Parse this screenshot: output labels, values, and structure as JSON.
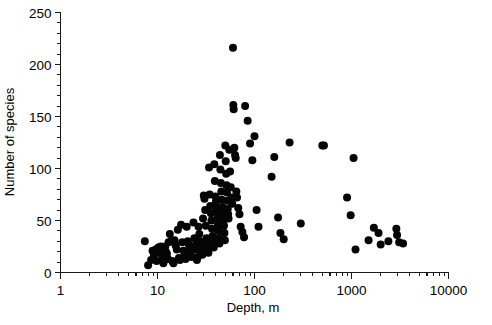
{
  "chart_data": {
    "type": "scatter",
    "title": "",
    "xlabel": "Depth, m",
    "ylabel": "Number of species",
    "xscale": "log",
    "yscale": "linear",
    "xlim": [
      1,
      10000
    ],
    "ylim": [
      0,
      250
    ],
    "grid": false,
    "legend": null,
    "x_tick_labels": [
      "1",
      "10",
      "100",
      "1000",
      "10000"
    ],
    "x_tick_values": [
      1,
      10,
      100,
      1000,
      10000
    ],
    "y_tick_labels": [
      "0",
      "50",
      "100",
      "150",
      "200",
      "250"
    ],
    "y_tick_values": [
      0,
      50,
      100,
      150,
      200,
      250
    ],
    "y_minor_step": 10,
    "marker": "filled-circle",
    "marker_color": "#050505",
    "marker_size_px": 4.6,
    "n_points": 148,
    "points": [
      [
        7.4,
        30
      ],
      [
        8.0,
        7
      ],
      [
        8.6,
        12
      ],
      [
        8.9,
        21
      ],
      [
        9.2,
        17
      ],
      [
        9.6,
        22
      ],
      [
        9.8,
        11
      ],
      [
        10.0,
        20
      ],
      [
        10.2,
        24
      ],
      [
        10.4,
        19
      ],
      [
        10.6,
        22
      ],
      [
        10.8,
        25
      ],
      [
        11.0,
        21
      ],
      [
        11.2,
        14
      ],
      [
        11.5,
        9
      ],
      [
        11.8,
        12
      ],
      [
        12.0,
        25
      ],
      [
        12.2,
        20
      ],
      [
        12.5,
        18
      ],
      [
        12.8,
        13
      ],
      [
        13.0,
        29
      ],
      [
        13.4,
        37
      ],
      [
        13.8,
        30
      ],
      [
        14.2,
        11
      ],
      [
        14.6,
        9
      ],
      [
        15.0,
        31
      ],
      [
        15.4,
        26
      ],
      [
        15.8,
        22
      ],
      [
        16.2,
        41
      ],
      [
        16.6,
        14
      ],
      [
        17.0,
        12
      ],
      [
        17.5,
        46
      ],
      [
        18.0,
        29
      ],
      [
        18.5,
        21
      ],
      [
        19.0,
        16
      ],
      [
        19.5,
        13
      ],
      [
        20.0,
        44
      ],
      [
        20.5,
        30
      ],
      [
        21.0,
        27
      ],
      [
        21.5,
        21
      ],
      [
        22.0,
        18
      ],
      [
        22.5,
        15
      ],
      [
        23.0,
        24
      ],
      [
        23.5,
        48
      ],
      [
        24.0,
        33
      ],
      [
        24.5,
        26
      ],
      [
        25.0,
        22
      ],
      [
        25.5,
        12
      ],
      [
        26.0,
        15
      ],
      [
        26.5,
        44
      ],
      [
        27.0,
        37
      ],
      [
        27.5,
        30
      ],
      [
        28.0,
        25
      ],
      [
        28.5,
        20
      ],
      [
        29.0,
        17
      ],
      [
        29.5,
        52
      ],
      [
        30.0,
        74
      ],
      [
        30.5,
        71
      ],
      [
        31.0,
        60
      ],
      [
        31.5,
        45
      ],
      [
        32.0,
        33
      ],
      [
        32.5,
        27
      ],
      [
        33.0,
        23
      ],
      [
        33.5,
        19
      ],
      [
        34.0,
        101
      ],
      [
        34.5,
        75
      ],
      [
        35.0,
        64
      ],
      [
        35.5,
        57
      ],
      [
        36.0,
        50
      ],
      [
        36.5,
        42
      ],
      [
        37.0,
        35
      ],
      [
        37.5,
        29
      ],
      [
        38.0,
        24
      ],
      [
        38.5,
        104
      ],
      [
        39.0,
        88
      ],
      [
        39.5,
        73
      ],
      [
        40.0,
        68
      ],
      [
        40.5,
        62
      ],
      [
        41.0,
        58
      ],
      [
        41.5,
        52
      ],
      [
        42.0,
        46
      ],
      [
        42.5,
        40
      ],
      [
        43.0,
        33
      ],
      [
        43.5,
        28
      ],
      [
        44.0,
        113
      ],
      [
        44.5,
        99
      ],
      [
        45.0,
        86
      ],
      [
        45.5,
        78
      ],
      [
        46.0,
        70
      ],
      [
        46.5,
        63
      ],
      [
        47.0,
        59
      ],
      [
        47.5,
        55
      ],
      [
        48.0,
        50
      ],
      [
        48.5,
        45
      ],
      [
        49.0,
        38
      ],
      [
        49.5,
        31
      ],
      [
        50.0,
        122
      ],
      [
        50.5,
        107
      ],
      [
        51.0,
        95
      ],
      [
        51.5,
        84
      ],
      [
        52.0,
        77
      ],
      [
        52.5,
        69
      ],
      [
        53.0,
        61
      ],
      [
        53.5,
        56
      ],
      [
        54.0,
        52
      ],
      [
        55.0,
        118
      ],
      [
        56.0,
        97
      ],
      [
        57.0,
        82
      ],
      [
        58.0,
        72
      ],
      [
        59.0,
        66
      ],
      [
        60.0,
        216
      ],
      [
        60.5,
        161
      ],
      [
        61.0,
        157
      ],
      [
        62.0,
        120
      ],
      [
        63.0,
        113
      ],
      [
        64.0,
        110
      ],
      [
        65.0,
        78
      ],
      [
        66.0,
        72
      ],
      [
        68.0,
        62
      ],
      [
        70.0,
        56
      ],
      [
        72.0,
        44
      ],
      [
        75.0,
        39
      ],
      [
        78.0,
        34
      ],
      [
        80.0,
        160
      ],
      [
        85.0,
        146
      ],
      [
        90.0,
        124
      ],
      [
        95.0,
        108
      ],
      [
        100.0,
        131
      ],
      [
        105.0,
        60
      ],
      [
        110.0,
        44
      ],
      [
        150.0,
        92
      ],
      [
        160.0,
        111
      ],
      [
        175.0,
        53
      ],
      [
        185.0,
        38
      ],
      [
        200.0,
        32
      ],
      [
        230.0,
        125
      ],
      [
        300.0,
        47
      ],
      [
        500.0,
        122
      ],
      [
        520.0,
        122
      ],
      [
        900.0,
        72
      ],
      [
        980.0,
        55
      ],
      [
        1050.0,
        110
      ],
      [
        1100.0,
        22
      ],
      [
        1500.0,
        31
      ],
      [
        1700.0,
        43
      ],
      [
        1900.0,
        38
      ],
      [
        2000.0,
        27
      ],
      [
        2400.0,
        30
      ],
      [
        2900.0,
        42
      ],
      [
        2950.0,
        36
      ],
      [
        3100.0,
        29
      ],
      [
        3400.0,
        28
      ]
    ]
  },
  "axes": {
    "x_title": "Depth, m",
    "y_title": "Number of species"
  }
}
